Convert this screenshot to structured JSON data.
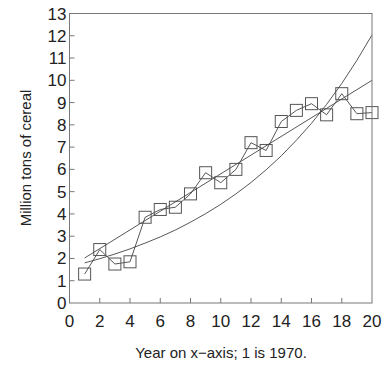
{
  "chart_data": {
    "type": "scatter",
    "title": "",
    "xlabel": "Year on x−axis; 1 is 1970.",
    "ylabel": "Million tons of cereal",
    "xlim": [
      0,
      20
    ],
    "ylim": [
      0,
      13
    ],
    "xticks": [
      0,
      2,
      4,
      6,
      8,
      10,
      12,
      14,
      16,
      18,
      20
    ],
    "yticks": [
      0,
      1,
      2,
      3,
      4,
      5,
      6,
      7,
      8,
      9,
      10,
      11,
      12,
      13
    ],
    "grid": false,
    "legend": null,
    "series": [
      {
        "name": "Observed",
        "style": "line+square-markers",
        "x": [
          1,
          2,
          3,
          4,
          5,
          6,
          7,
          8,
          9,
          10,
          11,
          12,
          13,
          14,
          15,
          16,
          17,
          18,
          19,
          20
        ],
        "y": [
          1.3,
          2.4,
          1.75,
          1.85,
          3.85,
          4.2,
          4.3,
          4.9,
          5.85,
          5.4,
          6.0,
          7.2,
          6.85,
          8.15,
          8.65,
          8.95,
          8.45,
          9.4,
          8.5,
          8.55
        ]
      },
      {
        "name": "Linear trend",
        "style": "line",
        "formula": "y = 1.6 + 0.42x",
        "x": [
          1,
          20
        ],
        "y": [
          2.02,
          10.0
        ]
      },
      {
        "name": "Exponential trend",
        "style": "line",
        "formula": "y = 1.63 e^(0.1x)",
        "x": [
          1,
          2,
          3,
          4,
          5,
          6,
          7,
          8,
          9,
          10,
          11,
          12,
          13,
          14,
          15,
          16,
          17,
          18,
          19,
          20
        ],
        "y": [
          1.8,
          1.99,
          2.2,
          2.43,
          2.69,
          2.97,
          3.28,
          3.63,
          4.01,
          4.43,
          4.9,
          5.41,
          5.98,
          6.61,
          7.31,
          8.07,
          8.92,
          9.86,
          10.9,
          12.04
        ]
      }
    ]
  }
}
